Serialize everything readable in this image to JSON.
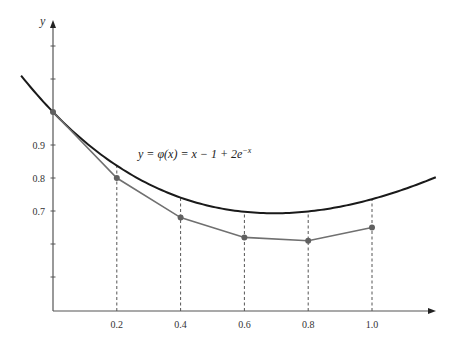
{
  "chart_data": {
    "type": "line",
    "title": "",
    "xlabel": "",
    "ylabel": "y",
    "annotation": "y = φ(x) = x − 1 + 2e^{−x}",
    "x_ticks": [
      "0.2",
      "0.4",
      "0.6",
      "0.8",
      "1.0"
    ],
    "y_ticks": [
      "0.7",
      "0.8",
      "0.9"
    ],
    "xlim": [
      0,
      1.2
    ],
    "ylim": [
      0.4,
      1.2
    ],
    "grid": false,
    "legend": "none",
    "series": [
      {
        "name": "exact solution y = φ(x) = x − 1 + 2e^{−x}",
        "style": "solid black curve",
        "x": [
          -0.1,
          0.0,
          0.2,
          0.4,
          0.6,
          0.8,
          1.0,
          1.2
        ],
        "values": [
          1.11,
          1.0,
          0.837,
          0.741,
          0.698,
          0.699,
          0.736,
          0.802
        ]
      },
      {
        "name": "approximation (polygonal line with points)",
        "style": "gray line with markers",
        "x": [
          0.0,
          0.2,
          0.4,
          0.6,
          0.8,
          1.0
        ],
        "values": [
          1.0,
          0.8,
          0.68,
          0.62,
          0.61,
          0.65
        ]
      }
    ],
    "dashed_verticals_at": [
      0.2,
      0.4,
      0.6,
      0.8,
      1.0
    ]
  },
  "labels": {
    "y_axis": "y",
    "equation_text": "y = φ(x) = x − 1 + 2e",
    "equation_exp": "−x"
  },
  "colors": {
    "exact_curve": "#1a1a1a",
    "approx_line": "#707070",
    "axis": "#555555",
    "dashed": "#555555"
  }
}
